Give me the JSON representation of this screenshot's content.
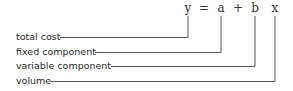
{
  "equation": {
    "symbols": [
      {
        "id": "y",
        "text": "y",
        "x": 188
      },
      {
        "id": "eq",
        "text": "=",
        "x": 204
      },
      {
        "id": "a",
        "text": "a",
        "x": 221
      },
      {
        "id": "plus",
        "text": "+",
        "x": 238
      },
      {
        "id": "b",
        "text": "b",
        "x": 255
      },
      {
        "id": "x",
        "text": "x",
        "x": 275
      }
    ]
  },
  "labels": [
    {
      "text": "total cost",
      "term": "y"
    },
    {
      "text": "fixed component",
      "term": "a"
    },
    {
      "text": "variable component",
      "term": "b"
    },
    {
      "text": "volume",
      "term": "x"
    }
  ]
}
